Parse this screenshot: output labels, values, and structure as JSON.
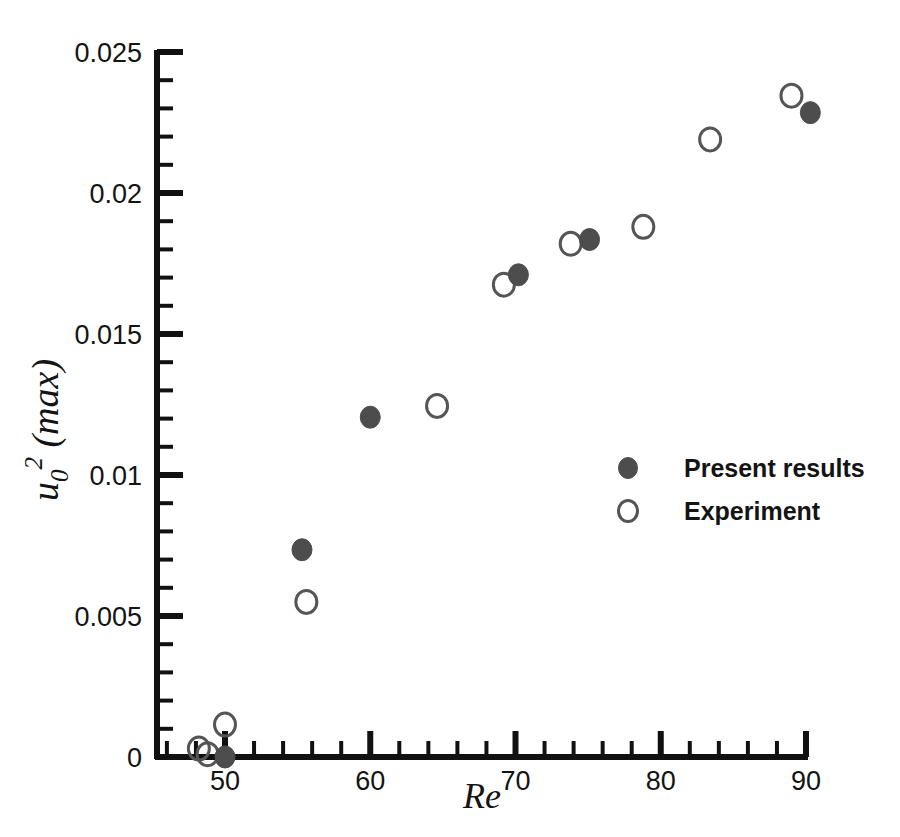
{
  "chart_data": {
    "type": "scatter",
    "title": "",
    "xlabel": "Re",
    "ylabel": "u_0^2 (max)",
    "ylabel_parts": {
      "base": "u",
      "subscript": "0",
      "superscript": "2",
      "suffix": "(max)"
    },
    "xlim": [
      45,
      90
    ],
    "ylim": [
      0,
      0.025
    ],
    "xticks": [
      50,
      60,
      70,
      80,
      90
    ],
    "xtick_labels": [
      "50",
      "60",
      "70",
      "80",
      "90"
    ],
    "x_minor_interval": 2,
    "yticks": [
      0,
      0.005,
      0.01,
      0.015,
      0.02,
      0.025
    ],
    "ytick_labels": [
      "0",
      "0.005",
      "0.01",
      "0.015",
      "0.02",
      "0.025"
    ],
    "y_minor_interval": 0.001,
    "grid": false,
    "legend_position": "center-right",
    "series": [
      {
        "name": "Present results",
        "marker": "filled-circle",
        "color": "#4d4d4d",
        "points": [
          {
            "x": 50.0,
            "y": 0.0
          },
          {
            "x": 55.3,
            "y": 0.00735
          },
          {
            "x": 60.0,
            "y": 0.01205
          },
          {
            "x": 70.2,
            "y": 0.0171
          },
          {
            "x": 75.1,
            "y": 0.01835
          },
          {
            "x": 90.3,
            "y": 0.02285
          }
        ]
      },
      {
        "name": "Experiment",
        "marker": "open-circle",
        "color": "#555555",
        "points": [
          {
            "x": 48.2,
            "y": 0.0003
          },
          {
            "x": 48.8,
            "y": 0.0001
          },
          {
            "x": 50.0,
            "y": 0.00115
          },
          {
            "x": 55.6,
            "y": 0.0055
          },
          {
            "x": 64.6,
            "y": 0.01245
          },
          {
            "x": 69.2,
            "y": 0.01675
          },
          {
            "x": 73.8,
            "y": 0.0182
          },
          {
            "x": 78.8,
            "y": 0.0188
          },
          {
            "x": 83.4,
            "y": 0.0219
          },
          {
            "x": 89.0,
            "y": 0.02345
          }
        ]
      }
    ]
  },
  "legend": {
    "items": [
      {
        "label": "Present results",
        "marker": "filled-circle"
      },
      {
        "label": "Experiment",
        "marker": "open-circle"
      }
    ]
  },
  "colors": {
    "axis": "#111111",
    "filled_marker": "#4d4d4d",
    "open_marker": "#555555",
    "text": "#141414",
    "background": "#ffffff"
  }
}
